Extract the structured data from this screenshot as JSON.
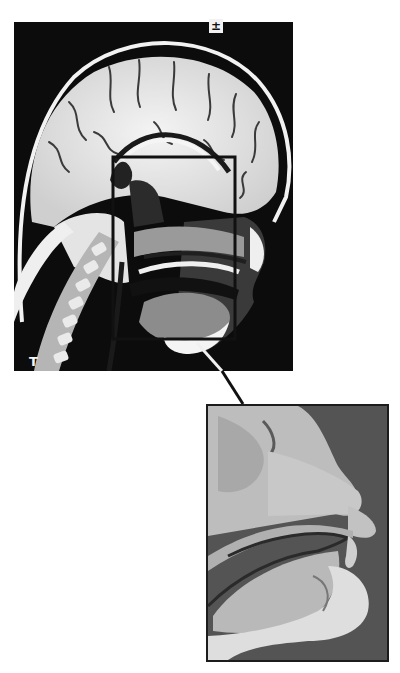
{
  "figure": {
    "mri_panel": {
      "description": "Sagittal MRI of head and neck",
      "orientation_marker_top": "±",
      "orientation_marker_bottom": "T",
      "highlight_box_color": "#111111"
    },
    "photo_panel": {
      "description": "Sagittal anatomical section of nasal and oral cavity"
    },
    "colors": {
      "background": "#ffffff",
      "mri_background": "#0c0c0c",
      "photo_background": "#555555",
      "connector_on_dark": "#f0f0f0",
      "connector_on_light": "#111111"
    }
  }
}
